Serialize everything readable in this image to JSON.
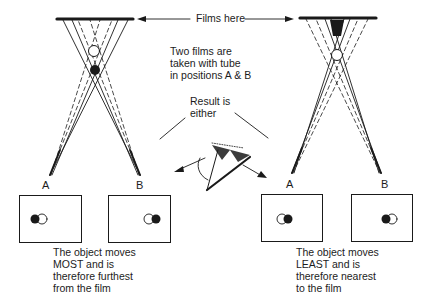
{
  "labels": {
    "films_here": "Films here",
    "two_films": [
      "Two films are",
      "taken with tube",
      "in positions A & B"
    ],
    "result": [
      "Result is",
      "either"
    ]
  },
  "left_case": {
    "tube_positions": [
      "A",
      "B"
    ],
    "caption": [
      "The object moves",
      "MOST and is",
      "therefore furthest",
      "from the film"
    ],
    "film_A": {
      "solid_dot": "left",
      "hollow_dot": "right"
    },
    "film_B": {
      "solid_dot": "right",
      "hollow_dot": "left"
    }
  },
  "right_case": {
    "tube_positions": [
      "A",
      "B"
    ],
    "caption": [
      "The object moves",
      "LEAST and is",
      "therefore nearest",
      "to the film"
    ],
    "film_A": {
      "solid_dot": "right",
      "hollow_dot": "left"
    },
    "film_B": {
      "solid_dot": "left",
      "hollow_dot": "right"
    }
  },
  "colors": {
    "ink": "#1a1a1a",
    "paper": "#ffffff"
  }
}
